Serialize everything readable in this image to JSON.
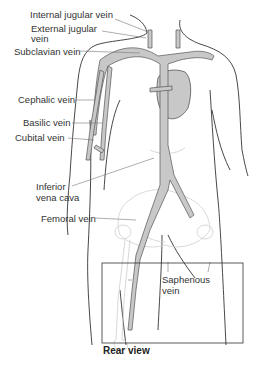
{
  "diagram": {
    "colors": {
      "vein_fill": "#c8c8c8",
      "vein_stroke": "#555555",
      "body_outline": "#333333",
      "bone_outline": "#d4d4d4",
      "leader_line": "#777777",
      "label_text": "#333333"
    },
    "labels": [
      {
        "id": "internal-jugular",
        "text_line1": "Internal jugular vein",
        "text_line2": ""
      },
      {
        "id": "external-jugular",
        "text_line1": "External jugular",
        "text_line2": "vein"
      },
      {
        "id": "subclavian",
        "text_line1": "Subclavian vein",
        "text_line2": ""
      },
      {
        "id": "cephalic",
        "text_line1": "Cephalic vein",
        "text_line2": ""
      },
      {
        "id": "basilic",
        "text_line1": "Basilic vein",
        "text_line2": ""
      },
      {
        "id": "cubital",
        "text_line1": "Cubital vein",
        "text_line2": ""
      },
      {
        "id": "inferior-vena-cava",
        "text_line1": "Inferior",
        "text_line2": "vena cava"
      },
      {
        "id": "femoral",
        "text_line1": "Femoral vein",
        "text_line2": ""
      },
      {
        "id": "saphenous",
        "text_line1": "Saphenous",
        "text_line2": "vein"
      }
    ],
    "inset_caption": "Rear view"
  }
}
